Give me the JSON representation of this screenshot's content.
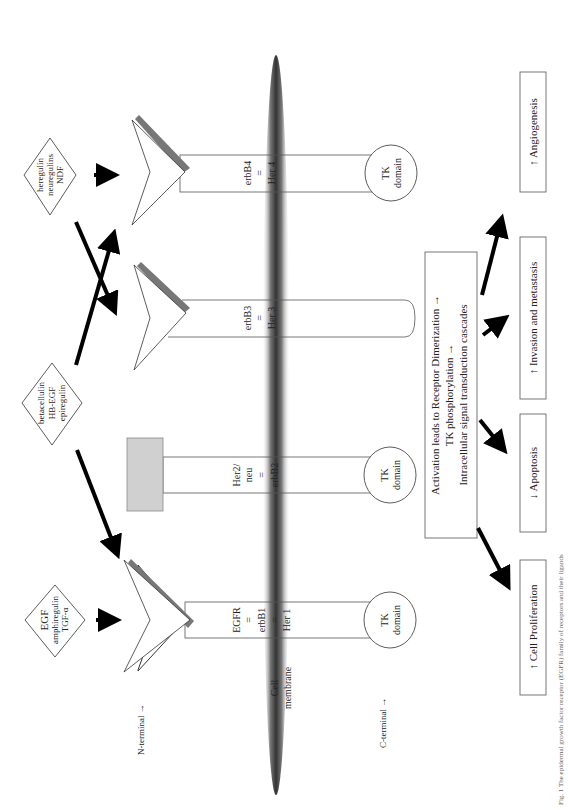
{
  "ligands": [
    {
      "id": "egf",
      "lines": [
        "EGF",
        "amphiregulin",
        "TGF-α"
      ]
    },
    {
      "id": "betacellulin",
      "lines": [
        "betacellulin",
        "HB-EGF",
        "epiregulin"
      ]
    },
    {
      "id": "heregulin",
      "lines": [
        "heregulin",
        "neuregulins",
        "NDF"
      ]
    }
  ],
  "receptors": [
    {
      "id": "egfr",
      "lines": [
        "EGFR",
        "=",
        "erbB1",
        "=",
        "Her 1"
      ],
      "tk": [
        "TK",
        "domain"
      ]
    },
    {
      "id": "her2",
      "lines": [
        "Her2/",
        "neu",
        "=",
        "erbB2"
      ],
      "tk": [
        "TK",
        "domain"
      ]
    },
    {
      "id": "erbb3",
      "lines": [
        "erbB3",
        "=",
        "Her 3"
      ]
    },
    {
      "id": "erbb4",
      "lines": [
        "erbB4",
        "=",
        "Her 4"
      ],
      "tk": [
        "TK",
        "domain"
      ]
    }
  ],
  "labels": {
    "n_terminal": "N-terminal →",
    "c_terminal": "C-terminal →",
    "cell_membrane": [
      "Cell",
      "membrane"
    ]
  },
  "activation": [
    "Activation leads to Receptor Dimerization →",
    "TK phosphorylation →",
    "Intracellular signal transduction cascades"
  ],
  "outcomes": [
    {
      "id": "proliferation",
      "text": "↑ Cell Proliferation"
    },
    {
      "id": "apoptosis",
      "text": "↓ Apoptosis"
    },
    {
      "id": "invasion",
      "text": "↑ Invasion and metastasis"
    },
    {
      "id": "angiogenesis",
      "text": "↑ Angiogenesis"
    }
  ],
  "caption": "Fig. 1 The epidermal growth factor receptor (EGFR) family of receptors and their ligands"
}
